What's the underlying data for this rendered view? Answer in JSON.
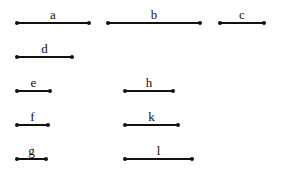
{
  "segments": [
    {
      "label": "a",
      "x1": 17,
      "x2": 89,
      "y": 23
    },
    {
      "label": "b",
      "x1": 108,
      "x2": 200,
      "y": 23
    },
    {
      "label": "c",
      "x1": 220,
      "x2": 264,
      "y": 23
    },
    {
      "label": "d",
      "x1": 17,
      "x2": 72,
      "y": 57
    },
    {
      "label": "e",
      "x1": 17,
      "x2": 50,
      "y": 91
    },
    {
      "label": "f",
      "x1": 17,
      "x2": 48,
      "y": 125
    },
    {
      "label": "g",
      "x1": 17,
      "x2": 46,
      "y": 159
    },
    {
      "label": "h",
      "x1": 125,
      "x2": 173,
      "y": 91
    },
    {
      "label": "k",
      "x1": 125,
      "x2": 178,
      "y": 125
    },
    {
      "label": "l",
      "x1": 125,
      "x2": 192,
      "y": 159
    }
  ]
}
